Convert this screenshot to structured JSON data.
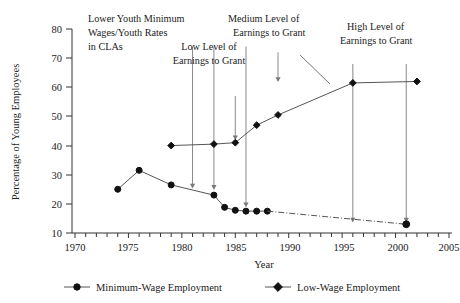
{
  "chart_data": {
    "type": "line",
    "title": "",
    "xlabel": "Year",
    "ylabel": "Percentage of Young Employees",
    "xlim": [
      1970,
      2005
    ],
    "ylim": [
      10,
      80
    ],
    "xticks": [
      1970,
      1975,
      1980,
      1985,
      1990,
      1995,
      2000,
      2005
    ],
    "xtick_labels": [
      "1970",
      "1975",
      "1980",
      "1985",
      "1990",
      "1995",
      "2000",
      "2005"
    ],
    "xminor_step": 1,
    "yticks": [
      10,
      20,
      30,
      40,
      50,
      60,
      70,
      80
    ],
    "ytick_labels": [
      "10",
      "20",
      "30",
      "40",
      "50",
      "60",
      "70",
      "80"
    ],
    "grid": false,
    "legend_position": "bottom",
    "series": [
      {
        "name": "Minimum-Wage Employment",
        "marker": "circle",
        "linestyle": "solid",
        "x": [
          1974,
          1976,
          1979,
          1983,
          1984,
          1985,
          1986,
          1987,
          1988
        ],
        "values": [
          25,
          31.5,
          26.5,
          23,
          18.8,
          17.8,
          17.5,
          17.5,
          17.5
        ]
      },
      {
        "name": "Low-Wage Employment",
        "marker": "diamond",
        "linestyle": "solid",
        "x": [
          1979,
          1983,
          1985,
          1987,
          1989,
          1996,
          2002
        ],
        "values": [
          40,
          40.5,
          41,
          47,
          50.5,
          61.5,
          62
        ]
      },
      {
        "name": "Minimum-Wage Employment projection",
        "marker": "circle",
        "linestyle": "dash-dot",
        "x": [
          1988,
          2001
        ],
        "values": [
          17.5,
          13
        ]
      }
    ],
    "annotations": [
      {
        "label": "Lower Youth Minimum Wages/Youth Rates in CLAs",
        "lines": [
          "Lower Youth Minimum",
          "Wages/Youth Rates",
          "in CLAs"
        ],
        "arrow_targets_years": [
          1981,
          1983,
          1986
        ],
        "arrow_from_value": 74,
        "arrow_to_values": [
          25.5,
          25,
          19
        ]
      },
      {
        "label": "Low Level of Earnings to Grant",
        "lines": [
          "Low Level of",
          "Earnings to Grant"
        ],
        "arrow_targets_years": [
          1985
        ],
        "arrow_from_value": 57,
        "arrow_to_values": [
          42
        ]
      },
      {
        "label": "Medium Level of Earnings to Grant",
        "lines": [
          "Medium Level of",
          "Earnings to Grant"
        ],
        "arrow_targets_years": [
          1989
        ],
        "arrow_from_value": 72,
        "arrow_to_values": [
          62
        ]
      },
      {
        "label": "High Level of Earnings to Grant",
        "lines": [
          "High Level of",
          "Earnings to Grant"
        ],
        "arrow_targets_years": [
          1996,
          2001
        ],
        "arrow_from_value": 68,
        "arrow_to_values": [
          13.8,
          13.8
        ]
      }
    ]
  },
  "axes": {
    "y_title": "Percentage of Young Employees",
    "x_title": "Year",
    "ytick_labels": [
      "80",
      "70",
      "60",
      "50",
      "40",
      "30",
      "20",
      "10"
    ],
    "xtick_labels": [
      "1970",
      "1975",
      "1980",
      "1985",
      "1990",
      "1995",
      "2000",
      "2005"
    ]
  },
  "annotations": {
    "lower_youth": {
      "line1": "Lower Youth Minimum",
      "line2": "Wages/Youth Rates",
      "line3": "in CLAs"
    },
    "low_level": {
      "line1": "Low Level of",
      "line2": "Earnings to Grant"
    },
    "medium_level": {
      "line1": "Medium Level of",
      "line2": "Earnings to Grant"
    },
    "high_level": {
      "line1": "High Level of",
      "line2": "Earnings to Grant"
    }
  },
  "legend": {
    "items": [
      {
        "label": "Minimum-Wage Employment",
        "marker": "circle"
      },
      {
        "label": "Low-Wage Employment",
        "marker": "diamond"
      }
    ]
  },
  "colors": {
    "ink": "#1a1a1a",
    "axis": "#333333",
    "line": "#555555",
    "marker": "#111111",
    "arrow": "#7a7a7a",
    "background": "#ffffff"
  }
}
